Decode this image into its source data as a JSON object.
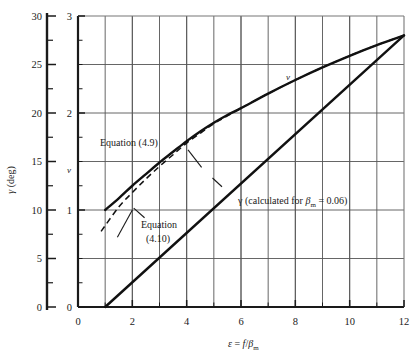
{
  "chart_data": {
    "type": "line",
    "title": "",
    "xlabel": "ε  =  f/βₘ",
    "ylabel_left": "γ (deg)",
    "ylabel_inner": "v",
    "xlim": [
      0,
      12
    ],
    "ylim_left": [
      0,
      30
    ],
    "ylim_inner": [
      0,
      3
    ],
    "grid": true,
    "legend_position": "none",
    "x_ticks": [
      0,
      2,
      4,
      6,
      8,
      10,
      12
    ],
    "x_tick_labels": [
      "0",
      "2",
      "4",
      "6",
      "8",
      "10",
      "12"
    ],
    "x_gridlines": [
      1,
      2,
      3,
      4,
      5,
      6,
      7,
      8,
      9,
      10,
      11
    ],
    "y_left_ticks": [
      0,
      5,
      10,
      15,
      20,
      25,
      30
    ],
    "y_left_tick_labels": [
      "0",
      "5",
      "10",
      "15",
      "20",
      "25",
      "30"
    ],
    "y_left_minor_ticks": [
      2.5,
      7.5,
      12.5,
      17.5,
      22.5,
      27.5
    ],
    "y_inner_ticks": [
      0,
      1,
      2,
      3
    ],
    "y_inner_tick_labels": [
      "0",
      "1",
      "2",
      "3"
    ],
    "y_inner_minor_step": 0.25,
    "y_inner_gridlines": [
      0.5,
      1,
      1.5,
      2,
      2.5
    ],
    "series": [
      {
        "name": "v (Equation (4.9))",
        "style": "solid",
        "axis": "inner",
        "x": [
          1.0,
          1.5,
          2.0,
          2.5,
          3.0,
          3.5,
          4.0,
          4.5,
          5.0,
          5.5,
          6.0,
          7.0,
          8.0,
          9.0,
          10.0,
          11.0,
          12.0
        ],
        "values": [
          1.0,
          1.12,
          1.25,
          1.37,
          1.49,
          1.6,
          1.71,
          1.81,
          1.9,
          1.98,
          2.05,
          2.2,
          2.34,
          2.47,
          2.59,
          2.7,
          2.8
        ]
      },
      {
        "name": "Equation (4.10)",
        "style": "dashed",
        "axis": "inner",
        "x": [
          0.85,
          1.5,
          2.0,
          2.5,
          3.0,
          3.5,
          4.0,
          4.5,
          5.0,
          5.5,
          6.0,
          7.0,
          8.0,
          9.0,
          10.0,
          11.0,
          12.0
        ],
        "values": [
          0.78,
          1.03,
          1.18,
          1.32,
          1.45,
          1.57,
          1.69,
          1.79,
          1.89,
          1.97,
          2.05,
          2.2,
          2.34,
          2.47,
          2.59,
          2.7,
          2.8
        ]
      },
      {
        "name": "γ (calculated for βₘ = 0.06)",
        "style": "solid",
        "axis": "left",
        "x": [
          1.0,
          12.0
        ],
        "values": [
          0.0,
          28.0
        ]
      }
    ],
    "annotations": [
      {
        "id": "eq49",
        "text": "Equation (4.9)",
        "x": 2.0,
        "y_inner": 1.62
      },
      {
        "id": "eq410_line1",
        "text": "Equation",
        "x": 2.6,
        "y_inner": 0.86
      },
      {
        "id": "eq410_line2",
        "text": "(4.10)",
        "x": 2.7,
        "y_inner": 0.72
      },
      {
        "id": "gamma_label",
        "text": "γ (calculated for βₘ  =  0.06)",
        "x": 5.6,
        "y_inner": 1.22
      },
      {
        "id": "v_curve_tag",
        "text": "v",
        "x": 7.5,
        "y_inner": 2.24
      }
    ]
  },
  "labels": {
    "y_axis_left": "γ (deg)",
    "y_axis_inner": "v",
    "x_axis_symbol": "ε",
    "x_axis_equals": "=",
    "x_axis_numerator": "f",
    "x_axis_slash": "/",
    "x_axis_beta": "β",
    "x_axis_beta_sub": "m",
    "equation_49": "Equation (4.9)",
    "equation_410_line1": "Equation",
    "equation_410_line2": "(4.10)",
    "gamma_note_pre": "γ (calculated for ",
    "gamma_note_beta": "β",
    "gamma_note_beta_sub": "m",
    "gamma_note_post": "  =  0.06)",
    "v_tag": "v"
  },
  "ticks": {
    "x": [
      "0",
      "2",
      "4",
      "6",
      "8",
      "10",
      "12"
    ],
    "y_left": [
      "30",
      "25",
      "20",
      "15",
      "10",
      "5",
      "0"
    ],
    "y_inner": [
      "3",
      "2",
      "1",
      "0"
    ]
  },
  "colors": {
    "ink": "#1a1a1a",
    "grid": "#555555",
    "background": "#ffffff",
    "curve": "#111111"
  }
}
